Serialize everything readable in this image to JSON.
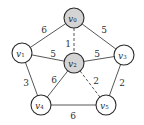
{
  "diagram": {
    "type": "weighted-undirected-graph",
    "nodes": [
      {
        "id": "v0",
        "label": "v",
        "sub": "0",
        "x": 74,
        "y": 18,
        "highlighted": true
      },
      {
        "id": "v1",
        "label": "v",
        "sub": "1",
        "x": 22,
        "y": 53,
        "highlighted": false
      },
      {
        "id": "v2",
        "label": "v",
        "sub": "2",
        "x": 74,
        "y": 63,
        "highlighted": true
      },
      {
        "id": "v3",
        "label": "v",
        "sub": "3",
        "x": 124,
        "y": 55,
        "highlighted": false
      },
      {
        "id": "v4",
        "label": "v",
        "sub": "4",
        "x": 41,
        "y": 105,
        "highlighted": false
      },
      {
        "id": "v5",
        "label": "v",
        "sub": "5",
        "x": 106,
        "y": 105,
        "highlighted": false
      }
    ],
    "edges": [
      {
        "from": "v0",
        "to": "v1",
        "weight": "6",
        "dashed": false,
        "lx": 44,
        "ly": 30
      },
      {
        "from": "v0",
        "to": "v3",
        "weight": "5",
        "dashed": false,
        "lx": 104,
        "ly": 30
      },
      {
        "from": "v0",
        "to": "v2",
        "weight": "1",
        "dashed": true,
        "lx": 68,
        "ly": 44
      },
      {
        "from": "v1",
        "to": "v2",
        "weight": "5",
        "dashed": false,
        "lx": 53,
        "ly": 54
      },
      {
        "from": "v2",
        "to": "v3",
        "weight": "5",
        "dashed": false,
        "lx": 97,
        "ly": 54
      },
      {
        "from": "v1",
        "to": "v4",
        "weight": "3",
        "dashed": false,
        "lx": 26,
        "ly": 83
      },
      {
        "from": "v2",
        "to": "v4",
        "weight": "6",
        "dashed": false,
        "lx": 54,
        "ly": 80
      },
      {
        "from": "v2",
        "to": "v5",
        "weight": "2",
        "dashed": true,
        "lx": 96,
        "ly": 81
      },
      {
        "from": "v3",
        "to": "v5",
        "weight": "2",
        "dashed": false,
        "lx": 122,
        "ly": 83
      },
      {
        "from": "v4",
        "to": "v5",
        "weight": "6",
        "dashed": false,
        "lx": 73,
        "ly": 116
      }
    ],
    "colors": {
      "highlight_fill": "#d4d4d4",
      "node_fill": "#ffffff",
      "stroke": "#2a2a2a"
    },
    "node_radius": 10
  }
}
